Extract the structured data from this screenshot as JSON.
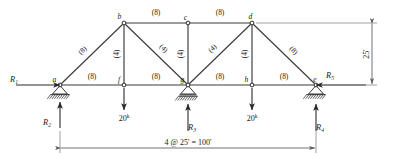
{
  "figure": {
    "type": "structural-truss"
  },
  "nodes": [
    {
      "id": "a",
      "label": "a",
      "x": 60,
      "y": 85,
      "label_dx": -5.5,
      "label_dy": -3.5
    },
    {
      "id": "b",
      "label": "b",
      "x": 124,
      "y": 23,
      "label_dx": -4.5,
      "label_dy": -4.0
    },
    {
      "id": "c",
      "label": "c",
      "x": 188,
      "y": 23,
      "label_dx": -2.5,
      "label_dy": -3.5
    },
    {
      "id": "d",
      "label": "d",
      "x": 252,
      "y": 23,
      "label_dx": -1.5,
      "label_dy": -4.5
    },
    {
      "id": "e",
      "label": "e",
      "x": 316,
      "y": 85,
      "label_dx": -1.0,
      "label_dy": -3.5
    },
    {
      "id": "f",
      "label": "f",
      "x": 124,
      "y": 85,
      "label_dx": -5.0,
      "label_dy": -3.5
    },
    {
      "id": "g",
      "label": "g",
      "x": 188,
      "y": 85,
      "label_dx": -5.5,
      "label_dy": -3.5
    },
    {
      "id": "h",
      "label": "h",
      "x": 252,
      "y": 85,
      "label_dx": -5.5,
      "label_dy": -3.5
    }
  ],
  "members": [
    {
      "id": "a-b",
      "from": "a",
      "to": "b",
      "label": "(8)",
      "lx": 84,
      "ly": 52,
      "rotate": -44
    },
    {
      "id": "b-c",
      "from": "b",
      "to": "c",
      "label": "(8)",
      "lx": 156,
      "ly": 15,
      "rotate": 0
    },
    {
      "id": "c-d",
      "from": "c",
      "to": "d",
      "label": "(8)",
      "lx": 220,
      "ly": 15,
      "rotate": 0
    },
    {
      "id": "d-e",
      "from": "d",
      "to": "e",
      "label": "(8)",
      "lx": 292,
      "ly": 52,
      "rotate": 44
    },
    {
      "id": "a-f",
      "from": "a",
      "to": "f",
      "label": "(8)",
      "lx": 92,
      "ly": 79,
      "rotate": 0
    },
    {
      "id": "f-g",
      "from": "f",
      "to": "g",
      "label": "(8)",
      "lx": 156,
      "ly": 79,
      "rotate": 0
    },
    {
      "id": "g-h",
      "from": "g",
      "to": "h",
      "label": "(8)",
      "lx": 220,
      "ly": 79,
      "rotate": 0
    },
    {
      "id": "h-e",
      "from": "h",
      "to": "e",
      "label": "(8)",
      "lx": 284,
      "ly": 79,
      "rotate": 0
    },
    {
      "id": "b-f",
      "from": "b",
      "to": "f",
      "label": "(4)",
      "lx": 119,
      "ly": 54,
      "rotate": -90
    },
    {
      "id": "c-g",
      "from": "c",
      "to": "g",
      "label": "(4)",
      "lx": 183,
      "ly": 54,
      "rotate": -90
    },
    {
      "id": "d-h",
      "from": "d",
      "to": "h",
      "label": "(4)",
      "lx": 247,
      "ly": 54,
      "rotate": -90
    },
    {
      "id": "b-g",
      "from": "b",
      "to": "g",
      "label": "(4)",
      "lx": 162,
      "ly": 50,
      "rotate": 44
    },
    {
      "id": "g-d",
      "from": "g",
      "to": "d",
      "label": "(4)",
      "lx": 214,
      "ly": 50,
      "rotate": -44
    }
  ],
  "supports": [
    {
      "id": "support-a",
      "node": "a",
      "type": "pin-hatched"
    },
    {
      "id": "support-g",
      "node": "g",
      "type": "roller-hatched"
    },
    {
      "id": "support-e",
      "node": "e",
      "type": "pin-hatched"
    }
  ],
  "reactions": [
    {
      "id": "R1",
      "label": "R",
      "subscript": "1",
      "direction": "right",
      "tip_x": 60,
      "tip_y": 85,
      "tail_x": 16,
      "tail_y": 85,
      "label_x": 14,
      "label_y": 82
    },
    {
      "id": "R2",
      "label": "R",
      "subscript": "2",
      "direction": "up",
      "tip_x": 60,
      "tip_y": 102,
      "tail_x": 60,
      "tail_y": 128,
      "label_x": 47,
      "label_y": 125
    },
    {
      "id": "R3",
      "label": "R",
      "subscript": "3",
      "direction": "up",
      "tip_x": 188,
      "tip_y": 104,
      "tail_x": 188,
      "tail_y": 131,
      "label_x": 192,
      "label_y": 130
    },
    {
      "id": "R4",
      "label": "R",
      "subscript": "4",
      "direction": "up",
      "tip_x": 316,
      "tip_y": 104,
      "tail_x": 316,
      "tail_y": 131,
      "label_x": 320,
      "label_y": 130
    },
    {
      "id": "R5",
      "label": "R",
      "subscript": "5",
      "direction": "left",
      "tip_x": 316,
      "tip_y": 85,
      "tail_x": 366,
      "tail_y": 85,
      "label_x": 330,
      "label_y": 78
    }
  ],
  "loads": [
    {
      "id": "load-f",
      "node": "f",
      "value": "20",
      "unit": "k",
      "tail_x": 124,
      "tail_y": 88,
      "tip_x": 124,
      "tip_y": 110,
      "label_x": 124,
      "label_y": 121
    },
    {
      "id": "load-h",
      "node": "h",
      "value": "20",
      "unit": "k",
      "tail_x": 252,
      "tail_y": 88,
      "tip_x": 252,
      "tip_y": 110,
      "label_x": 252,
      "label_y": 121
    }
  ],
  "dimensions": [
    {
      "id": "span-dimension",
      "orientation": "horizontal",
      "text": "4 @ 25' = 100'",
      "x1": 60,
      "x2": 316,
      "y": 148,
      "label_x": 188,
      "label_y": 145,
      "ext_top": 131
    },
    {
      "id": "height-dimension",
      "orientation": "vertical",
      "text": "25'",
      "y1": 23,
      "y2": 85,
      "x": 372,
      "label_x": 369,
      "label_y": 54,
      "ext_left_top": 256,
      "ext_left_bottom": 322
    }
  ],
  "colors": {
    "member": "#3b3b3b",
    "force": "#2b2b2b",
    "dimension": "#5a5a5a",
    "text": "#1a1a1a",
    "background": "#ffffff"
  }
}
